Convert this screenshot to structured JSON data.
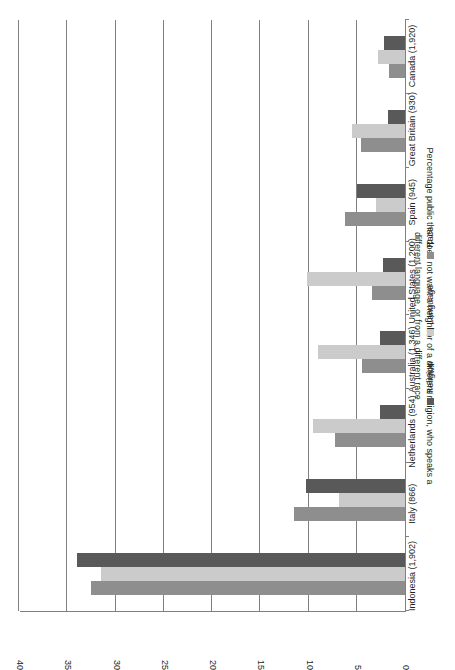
{
  "chart_data": {
    "type": "bar",
    "orientation": "horizontal",
    "title": "",
    "xlabel": "",
    "ylabel": "Percentage public that does not want a neighbor of a different religion, who speaks a different language, or from a different race",
    "ylabel_lines": [
      "Percentage public that does not want a neighbor of a different religion, who speaks a",
      "different language, or from a different race"
    ],
    "ylim": [
      0,
      40
    ],
    "ticks": [
      "0",
      "5",
      "10",
      "15",
      "20",
      "25",
      "30",
      "35",
      "40"
    ],
    "tick_values": [
      0,
      5,
      10,
      15,
      20,
      25,
      30,
      35,
      40
    ],
    "grid": true,
    "legend_position": "bottom",
    "categories": [
      "Indonesia (1,902)",
      "Italy (866)",
      "Netherlands (954)",
      "Australia (1,346)",
      "United States (1,200)",
      "Spain (945)",
      "Great Britain (930)",
      "Canada (1,920)"
    ],
    "series": [
      {
        "name": "Religion",
        "color": "#595959",
        "values": [
          34.0,
          10.3,
          2.6,
          2.6,
          2.3,
          5.0,
          1.8,
          2.2
        ]
      },
      {
        "name": "Language",
        "color": "#cbcbcb",
        "values": [
          31.5,
          6.8,
          9.5,
          9.0,
          10.2,
          3.0,
          5.5,
          2.8
        ]
      },
      {
        "name": "Race",
        "color": "#8e8e8e",
        "values": [
          32.5,
          11.5,
          7.3,
          4.5,
          3.4,
          6.2,
          4.6,
          1.7
        ]
      }
    ]
  }
}
